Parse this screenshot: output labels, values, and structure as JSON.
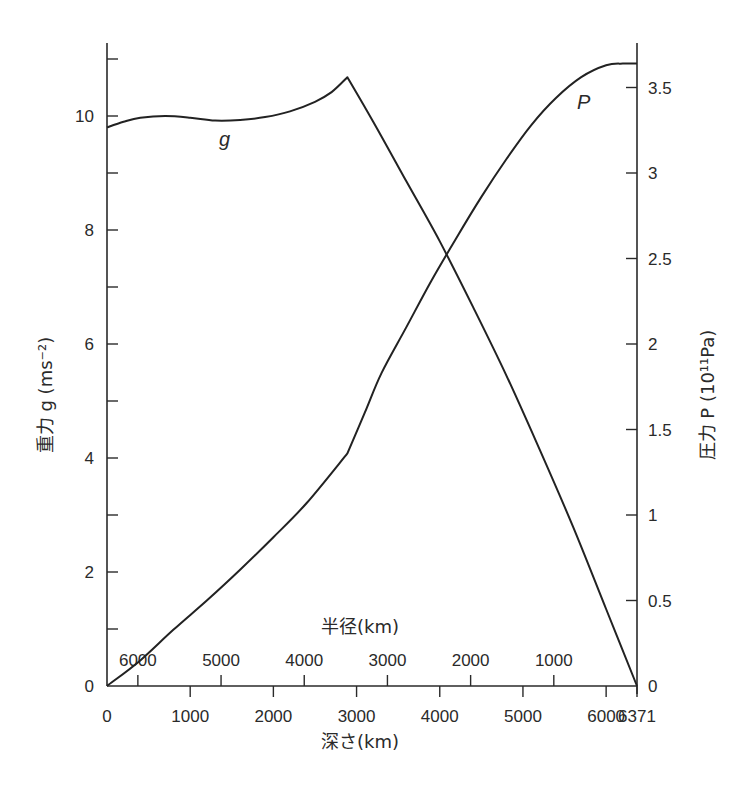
{
  "chart_data": {
    "type": "line",
    "title": "",
    "xlabel": "深さ(km)",
    "x2label": "半径(km)",
    "ylabel": "重力 g (ms⁻²)",
    "y2label": "圧力 P (10¹¹Pa)",
    "xlim": [
      0,
      6371
    ],
    "ylim": [
      0,
      11
    ],
    "y2lim": [
      0,
      3.7
    ],
    "x_ticks": [
      0,
      1000,
      2000,
      3000,
      4000,
      5000,
      6000,
      6371
    ],
    "x_tick_labels": [
      "0",
      "1000",
      "2000",
      "3000",
      "4000",
      "5000",
      "6000",
      "6371"
    ],
    "x2_ticks_depth": [
      371,
      1371,
      2371,
      3371,
      4371,
      5371
    ],
    "x2_tick_labels": [
      "6000",
      "5000",
      "4000",
      "3000",
      "2000",
      "1000"
    ],
    "y_ticks": [
      0,
      1,
      2,
      3,
      4,
      5,
      6,
      7,
      8,
      9,
      10,
      11
    ],
    "y_tick_labels": {
      "0": "0",
      "2": "2",
      "4": "4",
      "6": "6",
      "8": "8",
      "10": "10"
    },
    "y2_ticks": [
      0,
      0.5,
      1,
      1.5,
      2,
      2.5,
      3,
      3.5
    ],
    "y2_tick_labels": [
      "0",
      "0.5",
      "1",
      "1.5",
      "2",
      "2.5",
      "3",
      "3.5"
    ],
    "grid": false,
    "legend": "inline labels",
    "series": [
      {
        "name": "g",
        "axis": "left",
        "unit": "ms⁻²",
        "x": [
          0,
          200,
          400,
          700,
          1000,
          1300,
          1600,
          1900,
          2200,
          2500,
          2700,
          2890,
          3200,
          3600,
          4000,
          4400,
          4800,
          5200,
          5600,
          6000,
          6371
        ],
        "values": [
          9.8,
          9.9,
          9.97,
          10.0,
          9.97,
          9.92,
          9.93,
          9.98,
          10.08,
          10.25,
          10.42,
          10.68,
          9.9,
          8.85,
          7.8,
          6.65,
          5.45,
          4.15,
          2.8,
          1.35,
          0.0
        ]
      },
      {
        "name": "P",
        "axis": "right",
        "unit": "10¹¹Pa",
        "x": [
          0,
          400,
          800,
          1200,
          1600,
          2000,
          2400,
          2890,
          3100,
          3300,
          3600,
          3900,
          4200,
          4500,
          4800,
          5100,
          5400,
          5700,
          6000,
          6200,
          6371
        ],
        "values": [
          0.0,
          0.15,
          0.33,
          0.5,
          0.68,
          0.87,
          1.07,
          1.36,
          1.6,
          1.83,
          2.1,
          2.37,
          2.62,
          2.86,
          3.08,
          3.28,
          3.44,
          3.56,
          3.63,
          3.64,
          3.64
        ]
      }
    ],
    "annotations": [
      {
        "text": "g",
        "x_depth": 1430,
        "y": 9.5
      },
      {
        "text": "P",
        "x_depth": 5800,
        "y2": 3.35
      }
    ]
  },
  "labels": {
    "g_series": "g",
    "p_series": "P",
    "x_title": "深さ(km)",
    "x2_title": "半径(km)",
    "y_title": "重力 g (ms⁻²)",
    "y2_title": "圧力 P (10¹¹Pa)"
  }
}
